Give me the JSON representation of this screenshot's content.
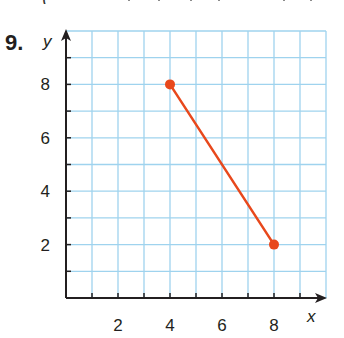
{
  "problem": {
    "number_label": "9."
  },
  "chart_data": {
    "type": "line",
    "title": "",
    "xlabel": "x",
    "ylabel": "y",
    "xlim": [
      0,
      10
    ],
    "ylim": [
      0,
      10
    ],
    "grid": true,
    "x_tick_labels": [
      "2",
      "4",
      "6",
      "8"
    ],
    "y_tick_labels": [
      "2",
      "4",
      "6",
      "8"
    ],
    "x_ticks_minor": [
      1,
      2,
      3,
      4,
      5,
      6,
      7,
      8,
      9
    ],
    "y_ticks_minor": [
      1,
      2,
      3,
      4,
      5,
      6,
      7,
      8,
      9
    ],
    "series": [
      {
        "name": "segment",
        "points": [
          {
            "x": 4,
            "y": 8
          },
          {
            "x": 8,
            "y": 2
          }
        ],
        "color": "#e8481c",
        "endpoints_marked": true
      }
    ],
    "legend": null
  },
  "colors": {
    "grid": "#9fd3ee",
    "axis": "#231f20",
    "segment": "#e8481c"
  }
}
